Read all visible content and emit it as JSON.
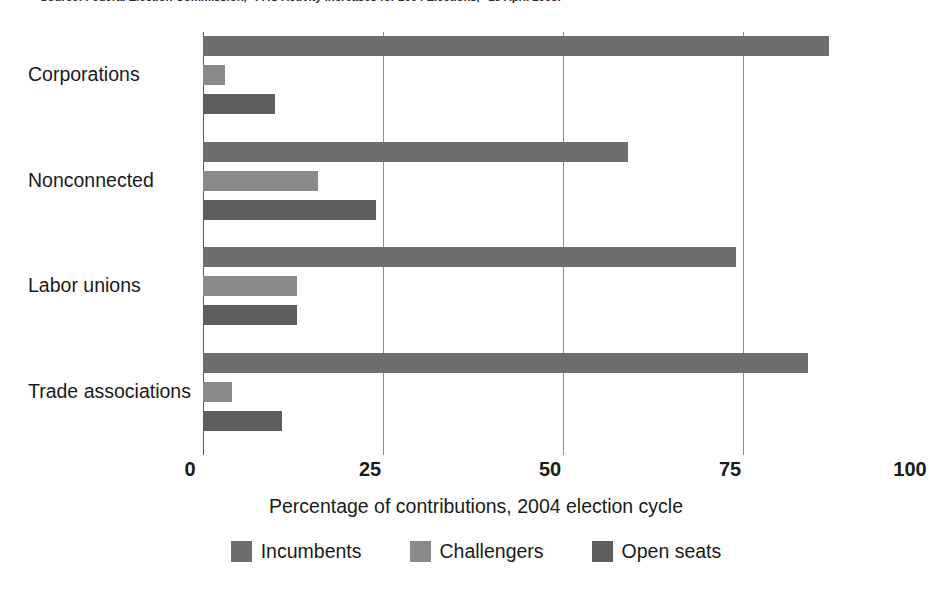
{
  "source_caption": "Source: Federal Election Commission, \"PAC Activity Increases for 2004 Elections,\" 13 April 2005.",
  "axis": {
    "x_title": "Percentage of contributions, 2004 election cycle",
    "x_ticks": [
      "0",
      "25",
      "50",
      "75",
      "100"
    ]
  },
  "legend": {
    "items": [
      {
        "label": "Incumbents",
        "color": "#6e6e6e",
        "swatch_name": "legend-swatch-incumbents"
      },
      {
        "label": "Challengers",
        "color": "#8a8a8a",
        "swatch_name": "legend-swatch-challengers"
      },
      {
        "label": "Open seats",
        "color": "#5e5e5e",
        "swatch_name": "legend-swatch-open-seats"
      }
    ]
  },
  "categories": [
    "Corporations",
    "Nonconnected",
    "Labor unions",
    "Trade associations"
  ],
  "chart_data": {
    "type": "bar",
    "orientation": "horizontal",
    "title": "",
    "subtitle": "",
    "xlabel": "Percentage of contributions, 2004 election cycle",
    "ylabel": "",
    "xlim": [
      0,
      100
    ],
    "xticks": [
      0,
      25,
      50,
      75,
      100
    ],
    "grid": "vertical",
    "legend_position": "bottom-center",
    "categories": [
      "Corporations",
      "Nonconnected",
      "Labor unions",
      "Trade associations"
    ],
    "series": [
      {
        "name": "Incumbents",
        "color": "#6e6e6e",
        "values": [
          87,
          59,
          74,
          84
        ]
      },
      {
        "name": "Challengers",
        "color": "#8a8a8a",
        "values": [
          3,
          16,
          13,
          4
        ]
      },
      {
        "name": "Open seats",
        "color": "#5e5e5e",
        "values": [
          10,
          24,
          13,
          11
        ]
      }
    ]
  }
}
